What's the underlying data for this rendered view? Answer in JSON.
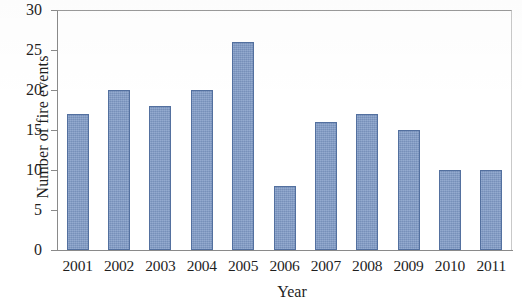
{
  "chart_data": {
    "type": "bar",
    "title": "",
    "xlabel": "Year",
    "ylabel": "Number of fire events",
    "categories": [
      "2001",
      "2002",
      "2003",
      "2004",
      "2005",
      "2006",
      "2007",
      "2008",
      "2009",
      "2010",
      "2011"
    ],
    "values": [
      17,
      20,
      18,
      20,
      26,
      8,
      16,
      17,
      15,
      10,
      10
    ],
    "ylim": [
      0,
      30
    ],
    "ytick_values": [
      0,
      5,
      10,
      15,
      20,
      25,
      30
    ],
    "ytick_labels": [
      "0",
      "5",
      "10",
      "15",
      "20",
      "25",
      "30"
    ],
    "grid": false,
    "legend": null,
    "bar_color": "#7f9ac6",
    "bar_border_color": "#53709f",
    "axis_color": "#8a8a8a"
  }
}
